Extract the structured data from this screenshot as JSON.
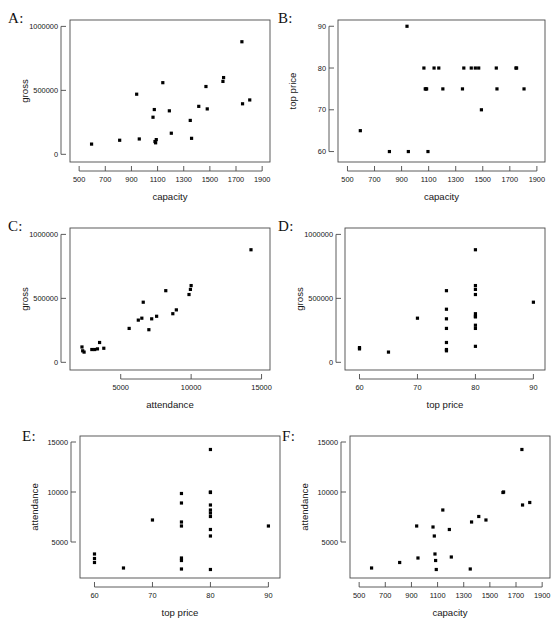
{
  "figure": {
    "width": 560,
    "height": 630,
    "background": "#ffffff",
    "point_color": "#000000",
    "axis_color": "#4a4a4a"
  },
  "panels": [
    {
      "letter": "A:",
      "xlabel": "capacity",
      "ylabel": "gross",
      "xticks": [
        500,
        700,
        900,
        1100,
        1300,
        1500,
        1700,
        1900
      ],
      "xticklabels": [
        "500",
        "700",
        "900",
        "1100",
        "1300",
        "1500",
        "1700",
        "1900"
      ],
      "yticks": [
        0,
        500000,
        1000000
      ],
      "yticklabels": [
        "0",
        "500000",
        "1000000"
      ],
      "xlim": [
        430,
        1960
      ],
      "ylim": [
        -60000,
        1050000
      ]
    },
    {
      "letter": "B:",
      "xlabel": "capacity",
      "ylabel": "top price",
      "xticks": [
        500,
        700,
        900,
        1100,
        1300,
        1500,
        1700,
        1900
      ],
      "xticklabels": [
        "500",
        "700",
        "900",
        "1100",
        "1300",
        "1500",
        "1700",
        "1900"
      ],
      "yticks": [
        60,
        70,
        80,
        90
      ],
      "yticklabels": [
        "60",
        "70",
        "80",
        "90"
      ],
      "xlim": [
        430,
        1960
      ],
      "ylim": [
        57.5,
        91.5
      ]
    },
    {
      "letter": "C:",
      "xlabel": "attendance",
      "ylabel": "gross",
      "xticks": [
        5000,
        10000,
        15000
      ],
      "xticklabels": [
        "5000",
        "10000",
        "15000"
      ],
      "yticks": [
        0,
        500000,
        1000000
      ],
      "yticklabels": [
        "0",
        "500000",
        "1000000"
      ],
      "xlim": [
        1400,
        15600
      ],
      "ylim": [
        -60000,
        1050000
      ]
    },
    {
      "letter": "D:",
      "xlabel": "top price",
      "ylabel": "gross",
      "xticks": [
        60,
        70,
        80,
        90
      ],
      "xticklabels": [
        "60",
        "70",
        "80",
        "90"
      ],
      "yticks": [
        0,
        500000,
        1000000
      ],
      "yticklabels": [
        "0",
        "500000",
        "1000000"
      ],
      "xlim": [
        57.5,
        92.0
      ],
      "ylim": [
        -60000,
        1050000
      ]
    },
    {
      "letter": "E:",
      "xlabel": "top price",
      "ylabel": "attendance",
      "xticks": [
        60,
        70,
        80,
        90
      ],
      "xticklabels": [
        "60",
        "70",
        "80",
        "90"
      ],
      "yticks": [
        5000,
        10000,
        15000
      ],
      "yticklabels": [
        "5000",
        "10000",
        "15000"
      ],
      "xlim": [
        57.5,
        92.0
      ],
      "ylim": [
        1400,
        15600
      ]
    },
    {
      "letter": "F:",
      "xlabel": "capacity",
      "ylabel": "attendance",
      "xticks": [
        500,
        700,
        900,
        1100,
        1300,
        1500,
        1700,
        1900
      ],
      "xticklabels": [
        "500",
        "700",
        "900",
        "1100",
        "1300",
        "1500",
        "1700",
        "1900"
      ],
      "yticks": [
        5000,
        10000,
        15000
      ],
      "yticklabels": [
        "5000",
        "10000",
        "15000"
      ],
      "xlim": [
        430,
        1960
      ],
      "ylim": [
        1400,
        15600
      ]
    }
  ],
  "chart_data": [
    {
      "panel": "A",
      "type": "scatter",
      "title": "",
      "xlabel": "capacity",
      "ylabel": "gross",
      "xlim": [
        430,
        1960
      ],
      "ylim": [
        -60000,
        1050000
      ],
      "grid": false,
      "legend": "none",
      "x": [
        595,
        810,
        940,
        960,
        1065,
        1075,
        1080,
        1085,
        1090,
        1140,
        1190,
        1205,
        1350,
        1360,
        1415,
        1470,
        1480,
        1600,
        1605,
        1745,
        1750,
        1805
      ],
      "y": [
        80000,
        110000,
        470000,
        120000,
        290000,
        350000,
        100000,
        90000,
        115000,
        560000,
        340000,
        165000,
        265000,
        125000,
        375000,
        530000,
        355000,
        570000,
        600000,
        880000,
        395000,
        425000
      ]
    },
    {
      "panel": "B",
      "type": "scatter",
      "title": "",
      "xlabel": "capacity",
      "ylabel": "top price",
      "xlim": [
        430,
        1960
      ],
      "ylim": [
        57.5,
        91.5
      ],
      "grid": false,
      "legend": "none",
      "x": [
        595,
        810,
        940,
        950,
        1065,
        1075,
        1080,
        1085,
        1095,
        1140,
        1175,
        1205,
        1350,
        1360,
        1415,
        1445,
        1470,
        1490,
        1600,
        1605,
        1745,
        1750,
        1805
      ],
      "y": [
        65,
        60,
        90,
        60,
        80,
        75,
        75,
        75,
        60,
        80,
        80,
        75,
        75,
        80,
        80,
        80,
        80,
        70,
        80,
        75,
        80,
        80,
        75
      ]
    },
    {
      "panel": "C",
      "type": "scatter",
      "title": "",
      "xlabel": "attendance",
      "ylabel": "gross",
      "xlim": [
        1400,
        15600
      ],
      "ylim": [
        -60000,
        1050000
      ],
      "grid": false,
      "legend": "none",
      "x": [
        2250,
        2300,
        2400,
        2950,
        3150,
        3350,
        3500,
        3800,
        5600,
        6250,
        6500,
        6600,
        7000,
        7200,
        7550,
        8200,
        8700,
        8950,
        9850,
        9950,
        10000,
        14250
      ],
      "y": [
        120000,
        90000,
        80000,
        100000,
        100000,
        105000,
        155000,
        110000,
        265000,
        330000,
        345000,
        470000,
        255000,
        340000,
        360000,
        560000,
        380000,
        410000,
        530000,
        570000,
        600000,
        880000
      ]
    },
    {
      "panel": "D",
      "type": "scatter",
      "title": "",
      "xlabel": "top price",
      "ylabel": "gross",
      "xlim": [
        57.5,
        92.0
      ],
      "ylim": [
        -60000,
        1050000
      ],
      "grid": false,
      "legend": "none",
      "x": [
        60,
        60,
        65,
        70,
        75,
        75,
        75,
        75,
        75,
        75,
        75,
        80,
        80,
        80,
        80,
        80,
        80,
        80,
        80,
        80,
        80,
        90
      ],
      "y": [
        105000,
        115000,
        80000,
        345000,
        560000,
        415000,
        340000,
        265000,
        155000,
        100000,
        90000,
        880000,
        600000,
        570000,
        530000,
        380000,
        360000,
        355000,
        290000,
        265000,
        125000,
        470000
      ]
    },
    {
      "panel": "E",
      "type": "scatter",
      "title": "",
      "xlabel": "top price",
      "ylabel": "attendance",
      "xlim": [
        57.5,
        92.0
      ],
      "ylim": [
        1400,
        15600
      ],
      "grid": false,
      "legend": "none",
      "x": [
        60,
        60,
        60,
        65,
        70,
        75,
        75,
        75,
        75,
        75,
        75,
        75,
        80,
        80,
        80,
        80,
        80,
        80,
        80,
        80,
        80,
        80,
        90
      ],
      "y": [
        3800,
        3350,
        2950,
        2400,
        7200,
        9850,
        8900,
        7000,
        6600,
        3400,
        3150,
        2300,
        14250,
        10000,
        9950,
        8700,
        8200,
        7900,
        7550,
        6250,
        5600,
        2250,
        6600
      ]
    },
    {
      "panel": "F",
      "type": "scatter",
      "title": "",
      "xlabel": "capacity",
      "ylabel": "attendance",
      "xlim": [
        430,
        1960
      ],
      "ylim": [
        1400,
        15600
      ],
      "grid": false,
      "legend": "none",
      "x": [
        595,
        810,
        940,
        950,
        1065,
        1075,
        1080,
        1085,
        1090,
        1140,
        1190,
        1205,
        1350,
        1360,
        1415,
        1470,
        1600,
        1605,
        1745,
        1750,
        1805
      ],
      "y": [
        2400,
        2950,
        6600,
        3400,
        6500,
        5600,
        3800,
        3150,
        2250,
        8200,
        6250,
        3500,
        2300,
        7000,
        7550,
        7200,
        9950,
        10000,
        14250,
        8700,
        8950
      ]
    }
  ]
}
